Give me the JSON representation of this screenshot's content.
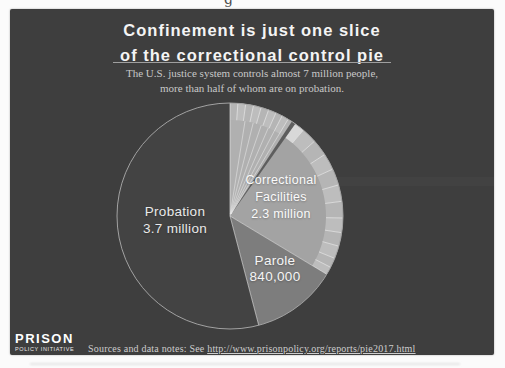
{
  "page": {
    "top_partial_text": "g"
  },
  "header": {
    "title_line1": "Confinement is just one slice",
    "title_line2": "of the correctional control pie",
    "subtitle_line1": "The U.S. justice system controls almost 7 million people,",
    "subtitle_line2": "more than half of whom are on probation."
  },
  "footer": {
    "logo_line1": "PRISON",
    "logo_line2": "POLICY INITIATIVE",
    "sources_prefix": "Sources and data notes: See ",
    "sources_link": "http://www.prisonpolicy.org/reports/pie2017.html"
  },
  "colors": {
    "page_background": "#fbfbfb",
    "card_background": "#3e3e3e",
    "title_text": "#f4f4f4",
    "subtitle_text": "#c8c8c8",
    "footer_text": "#cdcdcd"
  },
  "chart_data": {
    "type": "pie",
    "title": "Confinement is just one slice of the correctional control pie",
    "total_people": 6840000,
    "units": "people",
    "start_angle_deg": 0,
    "direction": "clockwise",
    "legend_position": "labels-on-slices",
    "slices": [
      {
        "label": "Correctional Facilities",
        "label_lines": [
          "Correctional",
          "Facilities"
        ],
        "value": 2300000,
        "value_label": "2.3 million",
        "color": "#a3a3a3"
      },
      {
        "label": "Parole",
        "label_lines": [
          "Parole"
        ],
        "value": 840000,
        "value_label": "840,000",
        "color": "#7d7d7d"
      },
      {
        "label": "Probation",
        "label_lines": [
          "Probation"
        ],
        "value": 3700000,
        "value_label": "3.7 million",
        "color": "#434343"
      }
    ],
    "detail": {
      "note": "outer ring of unlabeled facility-type subdivisions over the Correctional Facilities slice",
      "ring_inner_ratio": 0.85,
      "ring_base_colors": [
        "#b5b5b5",
        "#bdbdbd"
      ],
      "ring_divider_color": "#e2e2e2",
      "ring_divider_angles_deg": [
        4,
        8,
        12,
        16,
        20,
        24,
        27.5,
        31,
        40.5,
        48.5,
        57,
        65.5,
        74,
        82.5,
        91,
        98.5,
        105.5,
        112,
        117
      ],
      "light_subwedge": {
        "range_deg": [
          0,
          33.2
        ],
        "color": "#b0b0b0"
      },
      "dark_wedge": {
        "range_deg": [
          33.2,
          35.3
        ],
        "color": "#5e5e5e"
      },
      "bright_ring_segment": {
        "range_deg": [
          35.3,
          40.5
        ],
        "color": "#d8d8d8"
      },
      "fan_line_angles_deg": [
        9,
        14,
        19,
        23.5,
        27.5,
        31
      ],
      "fan_line_color": "rgba(236,236,236,0.75)",
      "boundary_line_color": "rgba(230,230,230,0.8)",
      "outline_color": "#a2a2a2"
    }
  }
}
